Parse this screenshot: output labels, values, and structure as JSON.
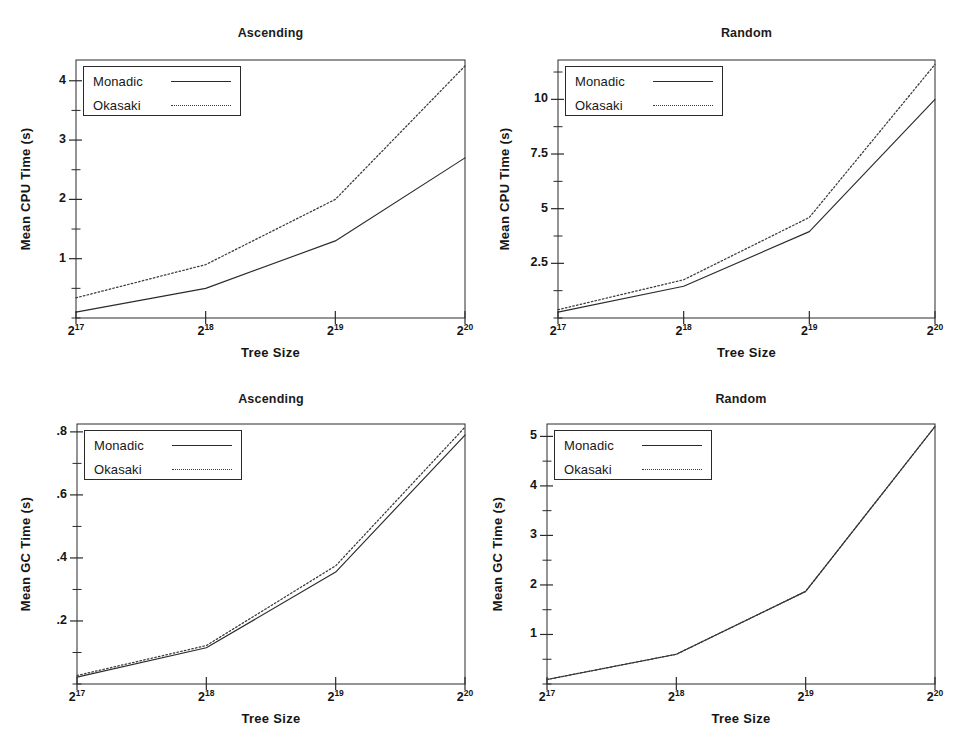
{
  "figure": {
    "background": "#ffffff",
    "line_color": "#2b2b2b",
    "dotted_color": "#3a3a3a",
    "axis_color": "#2a2a2a",
    "x_axis_label": "Tree Size",
    "x_tick_labels": [
      "2",
      "2",
      "2",
      "2"
    ],
    "x_tick_exponents": [
      "17",
      "18",
      "19",
      "20"
    ],
    "legend": {
      "monadic": "Monadic",
      "okasaki": "Okasaki"
    }
  },
  "chart_data": [
    {
      "id": "cpu-ascending",
      "type": "line",
      "title": "Ascending",
      "xlabel": "Tree Size",
      "ylabel": "Mean CPU Time (s)",
      "categories": [
        "2^17",
        "2^18",
        "2^19",
        "2^20"
      ],
      "x": [
        17,
        18,
        19,
        20
      ],
      "xlim": [
        17,
        20
      ],
      "ylim": [
        0,
        4.35
      ],
      "yticks": [
        1,
        2,
        3,
        4
      ],
      "ytick_labels": [
        "1",
        "2",
        "3",
        "4"
      ],
      "yminor_step": 0.5,
      "grid": false,
      "legend_position": "top-left",
      "series": [
        {
          "name": "Monadic",
          "style": "solid",
          "values": [
            0.1,
            0.5,
            1.3,
            2.7
          ]
        },
        {
          "name": "Okasaki",
          "style": "dotted",
          "values": [
            0.34,
            0.9,
            2.0,
            4.25
          ]
        }
      ]
    },
    {
      "id": "cpu-random",
      "type": "line",
      "title": "Random",
      "xlabel": "Tree Size",
      "ylabel": "Mean CPU Time (s)",
      "categories": [
        "2^17",
        "2^18",
        "2^19",
        "2^20"
      ],
      "x": [
        17,
        18,
        19,
        20
      ],
      "xlim": [
        17,
        20
      ],
      "ylim": [
        0,
        11.8
      ],
      "yticks": [
        2.5,
        5,
        7.5,
        10
      ],
      "ytick_labels": [
        "2.5",
        "5",
        "7.5",
        "10"
      ],
      "yminor_step": 1.25,
      "grid": false,
      "legend_position": "top-left",
      "series": [
        {
          "name": "Monadic",
          "style": "solid",
          "values": [
            0.27,
            1.45,
            3.95,
            10.0
          ]
        },
        {
          "name": "Okasaki",
          "style": "dotted",
          "values": [
            0.38,
            1.75,
            4.6,
            11.6
          ]
        }
      ]
    },
    {
      "id": "gc-ascending",
      "type": "line",
      "title": "Ascending",
      "xlabel": "Tree Size",
      "ylabel": "Mean GC Time (s)",
      "categories": [
        "2^17",
        "2^18",
        "2^19",
        "2^20"
      ],
      "x": [
        17,
        18,
        19,
        20
      ],
      "xlim": [
        17,
        20
      ],
      "ylim": [
        0,
        0.825
      ],
      "yticks": [
        0.2,
        0.4,
        0.6,
        0.8
      ],
      "ytick_labels": [
        ".2",
        ".4",
        ".6",
        ".8"
      ],
      "yminor_step": 0.1,
      "grid": false,
      "legend_position": "top-left",
      "series": [
        {
          "name": "Monadic",
          "style": "solid",
          "values": [
            0.022,
            0.115,
            0.355,
            0.79
          ]
        },
        {
          "name": "Okasaki",
          "style": "dotted",
          "values": [
            0.027,
            0.122,
            0.375,
            0.815
          ]
        }
      ]
    },
    {
      "id": "gc-random",
      "type": "line",
      "title": "Random",
      "xlabel": "Tree Size",
      "ylabel": "Mean GC Time (s)",
      "categories": [
        "2^17",
        "2^18",
        "2^19",
        "2^20"
      ],
      "x": [
        17,
        18,
        19,
        20
      ],
      "xlim": [
        17,
        20
      ],
      "ylim": [
        0,
        5.25
      ],
      "yticks": [
        1,
        2,
        3,
        4,
        5
      ],
      "ytick_labels": [
        "1",
        "2",
        "3",
        "4",
        "5"
      ],
      "yminor_step": 0.5,
      "grid": false,
      "legend_position": "top-left",
      "series": [
        {
          "name": "Monadic",
          "style": "solid",
          "values": [
            0.09,
            0.6,
            1.87,
            5.2
          ]
        },
        {
          "name": "Okasaki",
          "style": "dotted",
          "values": [
            0.09,
            0.6,
            1.87,
            5.2
          ]
        }
      ]
    }
  ]
}
